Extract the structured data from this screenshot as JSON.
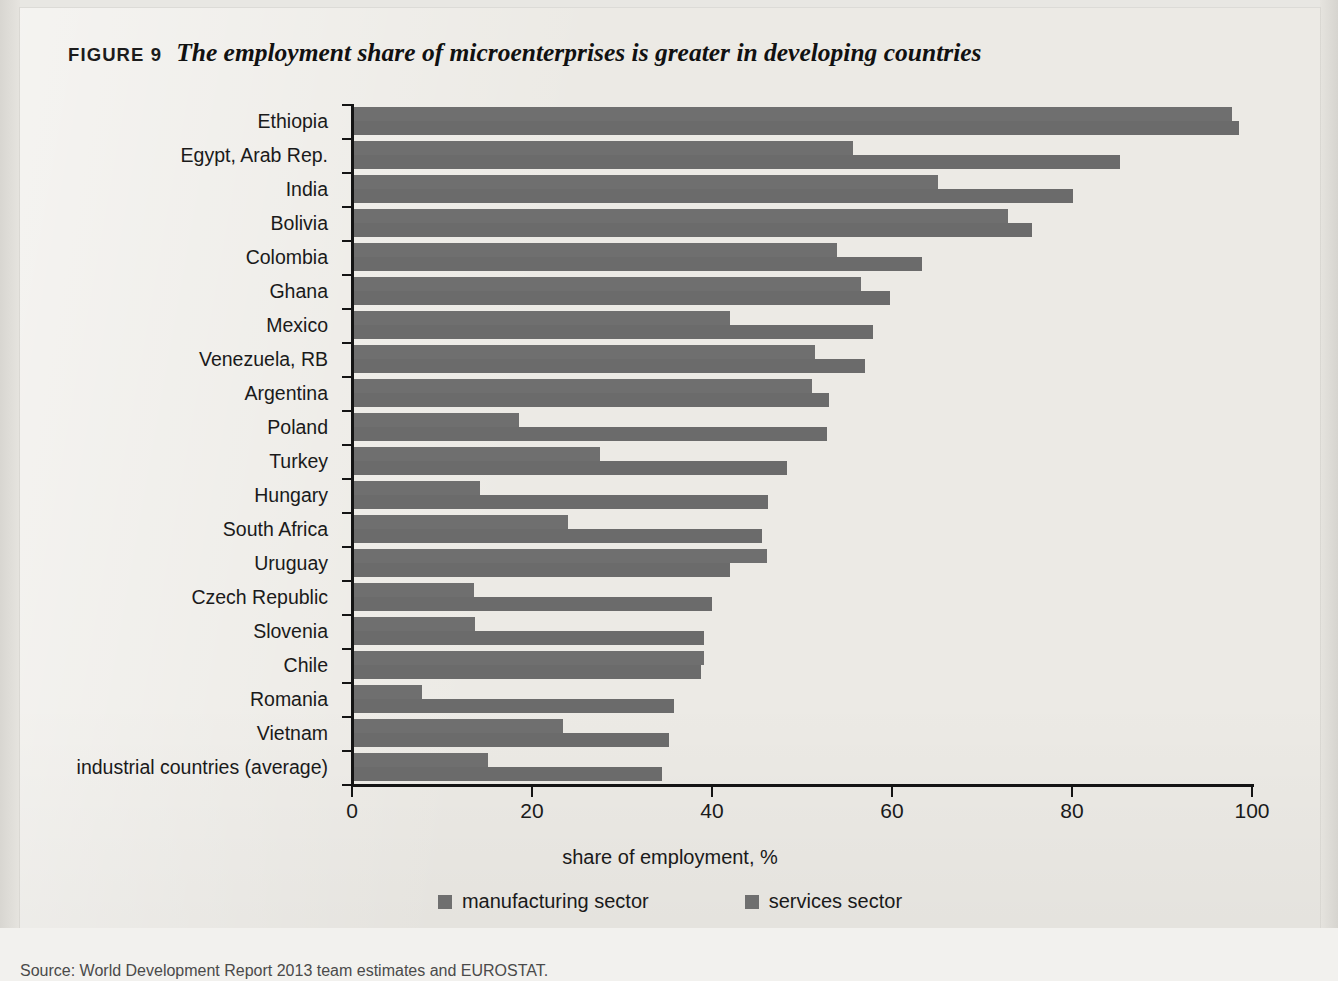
{
  "figure": {
    "label": "FIGURE 9",
    "title": "The employment share of microenterprises is greater in developing countries",
    "source": "Source: World Development Report 2013 team estimates and EUROSTAT."
  },
  "legend": {
    "manufacturing_label": "manufacturing sector",
    "services_label": "services sector",
    "manufacturing_color": "#6f6f6f",
    "services_color": "#6b6b6b"
  },
  "axis": {
    "x_title": "share of employment, %",
    "x_ticks": [
      "0",
      "20",
      "40",
      "60",
      "80",
      "100"
    ]
  },
  "chart_data": {
    "type": "bar",
    "title": "The employment share of microenterprises is greater in developing countries",
    "xlabel": "share of employment, %",
    "ylabel": "",
    "xlim": [
      0,
      100
    ],
    "grid": false,
    "orientation": "horizontal",
    "legend_position": "bottom",
    "categories": [
      "Ethiopia",
      "Egypt, Arab Rep.",
      "India",
      "Bolivia",
      "Colombia",
      "Ghana",
      "Mexico",
      "Venezuela, RB",
      "Argentina",
      "Poland",
      "Turkey",
      "Hungary",
      "South Africa",
      "Uruguay",
      "Czech Republic",
      "Slovenia",
      "Chile",
      "Romania",
      "Vietnam",
      "industrial countries (average)"
    ],
    "series": [
      {
        "name": "manufacturing sector",
        "values": [
          97.8,
          55.7,
          65.1,
          72.9,
          53.9,
          56.5,
          42.0,
          51.4,
          51.1,
          18.5,
          27.6,
          14.2,
          24.0,
          46.1,
          13.5,
          13.7,
          39.1,
          7.8,
          23.4,
          15.1
        ]
      },
      {
        "name": "services sector",
        "values": [
          98.6,
          85.3,
          80.1,
          75.5,
          63.3,
          59.8,
          57.9,
          57.0,
          53.0,
          52.8,
          48.3,
          46.2,
          45.5,
          42.0,
          40.0,
          39.1,
          38.8,
          35.8,
          35.2,
          34.4
        ]
      }
    ]
  }
}
